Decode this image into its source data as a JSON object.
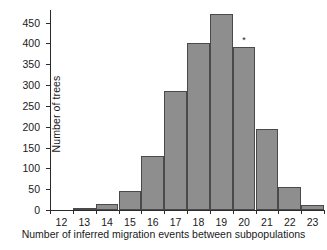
{
  "chart_data": {
    "type": "bar",
    "title": "",
    "subtitle": "",
    "xlabel": "Number of inferred migration events between subpopulations",
    "ylabel": "Number of trees",
    "categories": [
      "12",
      "13",
      "14",
      "15",
      "16",
      "17",
      "18",
      "19",
      "20",
      "21",
      "22",
      "23"
    ],
    "values": [
      0,
      6,
      15,
      45,
      130,
      285,
      400,
      470,
      392,
      195,
      55,
      13
    ],
    "bin_edges": [
      11.5,
      12.5,
      13.5,
      14.5,
      15.5,
      16.5,
      17.5,
      18.5,
      19.5,
      20.5,
      21.5,
      22.5,
      23.5
    ],
    "xlim": [
      11.5,
      23.5
    ],
    "ylim": [
      0,
      480
    ],
    "yticks": [
      0,
      50,
      100,
      150,
      200,
      250,
      300,
      350,
      400,
      450
    ],
    "ytick_labels": [
      "0",
      "50",
      "100",
      "150",
      "200",
      "250",
      "300",
      "350",
      "400",
      "450"
    ],
    "xticks": [
      12,
      13,
      14,
      15,
      16,
      17,
      18,
      19,
      20,
      21,
      22,
      23
    ],
    "xtick_labels": [
      "12",
      "13",
      "14",
      "15",
      "16",
      "17",
      "18",
      "19",
      "20",
      "21",
      "22",
      "23"
    ],
    "grid": false,
    "legend": null,
    "bar_fill_color": "#8e8e8e",
    "bar_edge_color": "#4a4a4a",
    "axis_color": "#2b2b2b",
    "background_color": "#ffffff",
    "annotations": [
      {
        "text": "*",
        "x": 20,
        "y": 392,
        "label": "asterisk-marker"
      }
    ]
  }
}
